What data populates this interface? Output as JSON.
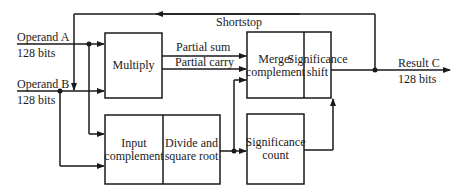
{
  "diagram": {
    "inputs": {
      "operand_a": {
        "label": "Operand A",
        "width": "128 bits"
      },
      "operand_b": {
        "label": "Operand B",
        "width": "128 bits"
      }
    },
    "output": {
      "label": "Result C",
      "width": "128 bits"
    },
    "feedback_label": "Shortstop",
    "blocks": {
      "multiply": "Multiply",
      "merge": "Merge/ complement",
      "sig_shift": "Significance shift",
      "input_comp": "Input complement",
      "divide": "Divide and square root",
      "sig_count": "Significance count"
    },
    "signals": {
      "partial_sum": "Partial sum",
      "partial_carry": "Partial carry"
    }
  }
}
